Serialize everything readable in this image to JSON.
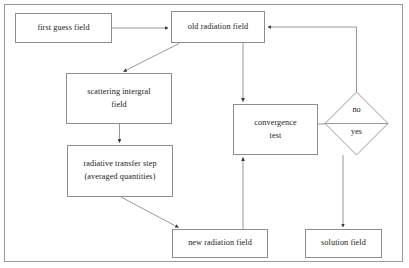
{
  "diagram": {
    "frame": {
      "border_color": "#9a9a9a"
    },
    "node_border_color": "#8d8d8d",
    "connector_color": "#8d8d8d",
    "nodes": [
      {
        "id": "first-guess-field",
        "label": "first guess field",
        "shape": "rect"
      },
      {
        "id": "old-radiation-field",
        "label": "old radiation field",
        "shape": "rect"
      },
      {
        "id": "scattering-integral",
        "label_line1": "scattering intergral",
        "label_line2": "field",
        "shape": "rect"
      },
      {
        "id": "radiative-transfer-step",
        "label_line1": "radiative transfer step",
        "label_line2": "(averaged quantities)",
        "shape": "rect"
      },
      {
        "id": "convergence-test",
        "label_line1": "convergence",
        "label_line2": "test",
        "shape": "rect"
      },
      {
        "id": "decision",
        "label_no": "no",
        "label_yes": "yes",
        "shape": "diamond"
      },
      {
        "id": "new-radiation-field",
        "label": "new radiation field",
        "shape": "rect"
      },
      {
        "id": "solution-field",
        "label": "solution field",
        "shape": "rect"
      }
    ],
    "edges": [
      {
        "from": "first-guess-field",
        "to": "old-radiation-field",
        "style": "straight-right"
      },
      {
        "from": "old-radiation-field",
        "to": "scattering-integral",
        "style": "diagonal-down-left"
      },
      {
        "from": "scattering-integral",
        "to": "radiative-transfer-step",
        "style": "straight-down"
      },
      {
        "from": "radiative-transfer-step",
        "to": "new-radiation-field",
        "style": "diagonal-down-right"
      },
      {
        "from": "new-radiation-field",
        "to": "convergence-test",
        "style": "straight-up"
      },
      {
        "from": "old-radiation-field",
        "to": "convergence-test",
        "style": "straight-down"
      },
      {
        "from": "convergence-test",
        "to": "decision",
        "style": "straight-right"
      },
      {
        "from": "decision",
        "to": "old-radiation-field",
        "style": "elbow-up-left",
        "branch": "no"
      },
      {
        "from": "decision",
        "to": "solution-field",
        "style": "straight-down",
        "branch": "yes"
      }
    ]
  }
}
